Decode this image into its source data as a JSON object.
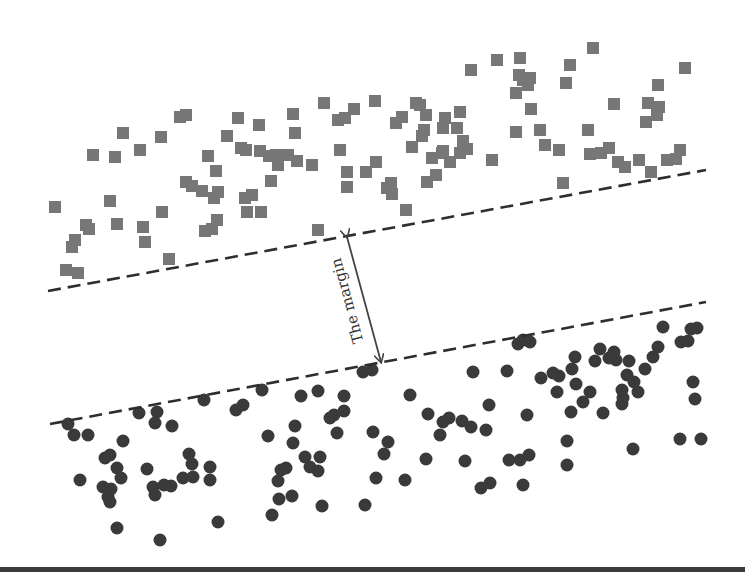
{
  "diagram": {
    "margin_label": "The margin",
    "colors": {
      "square": "#777777",
      "circle": "#3a3a3a",
      "line": "#2e2e2e",
      "arrow": "#444444",
      "text": "#333333"
    },
    "upper_boundary": {
      "x1": 48,
      "y1": 291,
      "x2": 706,
      "y2": 170,
      "style": "dashed"
    },
    "lower_boundary": {
      "x1": 50,
      "y1": 424,
      "x2": 706,
      "y2": 302,
      "style": "dashed"
    },
    "margin_arrow": {
      "x1": 347,
      "y1": 237,
      "x2": 381,
      "y2": 362
    },
    "squares": [
      [
        55,
        207
      ],
      [
        66,
        270
      ],
      [
        78,
        273
      ],
      [
        72,
        247
      ],
      [
        75,
        240
      ],
      [
        86,
        225
      ],
      [
        89,
        229
      ],
      [
        110,
        201
      ],
      [
        117,
        224
      ],
      [
        93,
        155
      ],
      [
        115,
        157
      ],
      [
        123,
        133
      ],
      [
        140,
        150
      ],
      [
        161,
        137
      ],
      [
        180,
        117
      ],
      [
        186,
        115
      ],
      [
        186,
        182
      ],
      [
        192,
        186
      ],
      [
        202,
        191
      ],
      [
        218,
        192
      ],
      [
        214,
        198
      ],
      [
        205,
        231
      ],
      [
        212,
        229
      ],
      [
        217,
        220
      ],
      [
        162,
        212
      ],
      [
        143,
        227
      ],
      [
        145,
        242
      ],
      [
        169,
        259
      ],
      [
        208,
        156
      ],
      [
        216,
        171
      ],
      [
        238,
        118
      ],
      [
        227,
        136
      ],
      [
        241,
        148
      ],
      [
        246,
        150
      ],
      [
        259,
        125
      ],
      [
        260,
        151
      ],
      [
        269,
        156
      ],
      [
        276,
        155
      ],
      [
        245,
        198
      ],
      [
        252,
        195
      ],
      [
        247,
        212
      ],
      [
        261,
        212
      ],
      [
        271,
        181
      ],
      [
        278,
        165
      ],
      [
        293,
        114
      ],
      [
        295,
        133
      ],
      [
        288,
        155
      ],
      [
        297,
        161
      ],
      [
        312,
        165
      ],
      [
        318,
        230
      ],
      [
        324,
        103
      ],
      [
        338,
        120
      ],
      [
        345,
        118
      ],
      [
        354,
        109
      ],
      [
        375,
        101
      ],
      [
        340,
        150
      ],
      [
        347,
        187
      ],
      [
        347,
        172
      ],
      [
        366,
        172
      ],
      [
        376,
        162
      ],
      [
        387,
        188
      ],
      [
        391,
        183
      ],
      [
        392,
        194
      ],
      [
        406,
        210
      ],
      [
        396,
        123
      ],
      [
        402,
        117
      ],
      [
        416,
        103
      ],
      [
        420,
        105
      ],
      [
        426,
        115
      ],
      [
        412,
        147
      ],
      [
        424,
        130
      ],
      [
        422,
        136
      ],
      [
        432,
        158
      ],
      [
        436,
        175
      ],
      [
        442,
        153
      ],
      [
        443,
        128
      ],
      [
        445,
        118
      ],
      [
        427,
        182
      ],
      [
        450,
        162
      ],
      [
        460,
        153
      ],
      [
        467,
        149
      ],
      [
        471,
        70
      ],
      [
        497,
        60
      ],
      [
        520,
        58
      ],
      [
        523,
        80
      ],
      [
        519,
        75
      ],
      [
        530,
        78
      ],
      [
        528,
        85
      ],
      [
        516,
        93
      ],
      [
        531,
        109
      ],
      [
        566,
        83
      ],
      [
        593,
        48
      ],
      [
        570,
        65
      ],
      [
        563,
        183
      ],
      [
        614,
        104
      ],
      [
        646,
        122
      ],
      [
        648,
        103
      ],
      [
        657,
        115
      ],
      [
        659,
        107
      ],
      [
        658,
        85
      ],
      [
        685,
        68
      ],
      [
        625,
        167
      ],
      [
        639,
        160
      ],
      [
        667,
        160
      ],
      [
        680,
        150
      ],
      [
        676,
        159
      ],
      [
        588,
        130
      ],
      [
        559,
        150
      ],
      [
        540,
        130
      ],
      [
        545,
        145
      ],
      [
        590,
        154
      ],
      [
        601,
        153
      ],
      [
        609,
        148
      ],
      [
        618,
        162
      ],
      [
        651,
        172
      ],
      [
        492,
        160
      ],
      [
        516,
        132
      ],
      [
        457,
        128
      ],
      [
        460,
        112
      ],
      [
        443,
        151
      ],
      [
        463,
        141
      ]
    ],
    "circles": [
      [
        68,
        424
      ],
      [
        74,
        435
      ],
      [
        88,
        435
      ],
      [
        123,
        441
      ],
      [
        105,
        458
      ],
      [
        110,
        455
      ],
      [
        117,
        468
      ],
      [
        121,
        478
      ],
      [
        80,
        480
      ],
      [
        103,
        487
      ],
      [
        108,
        497
      ],
      [
        110,
        502
      ],
      [
        111,
        489
      ],
      [
        147,
        469
      ],
      [
        153,
        487
      ],
      [
        155,
        495
      ],
      [
        171,
        486
      ],
      [
        164,
        485
      ],
      [
        183,
        478
      ],
      [
        189,
        454
      ],
      [
        193,
        477
      ],
      [
        192,
        464
      ],
      [
        210,
        467
      ],
      [
        210,
        480
      ],
      [
        218,
        522
      ],
      [
        160,
        540
      ],
      [
        117,
        528
      ],
      [
        139,
        413
      ],
      [
        157,
        412
      ],
      [
        155,
        423
      ],
      [
        172,
        426
      ],
      [
        204,
        400
      ],
      [
        236,
        410
      ],
      [
        243,
        405
      ],
      [
        262,
        390
      ],
      [
        268,
        436
      ],
      [
        301,
        396
      ],
      [
        318,
        391
      ],
      [
        334,
        415
      ],
      [
        330,
        418
      ],
      [
        363,
        372
      ],
      [
        372,
        370
      ],
      [
        295,
        426
      ],
      [
        293,
        443
      ],
      [
        281,
        470
      ],
      [
        278,
        481
      ],
      [
        310,
        467
      ],
      [
        318,
        471
      ],
      [
        286,
        468
      ],
      [
        305,
        457
      ],
      [
        320,
        457
      ],
      [
        337,
        433
      ],
      [
        344,
        411
      ],
      [
        344,
        396
      ],
      [
        373,
        432
      ],
      [
        384,
        454
      ],
      [
        388,
        442
      ],
      [
        376,
        478
      ],
      [
        365,
        505
      ],
      [
        322,
        506
      ],
      [
        292,
        496
      ],
      [
        279,
        499
      ],
      [
        272,
        515
      ],
      [
        410,
        395
      ],
      [
        428,
        414
      ],
      [
        443,
        422
      ],
      [
        449,
        418
      ],
      [
        462,
        421
      ],
      [
        471,
        427
      ],
      [
        486,
        430
      ],
      [
        489,
        405
      ],
      [
        507,
        371
      ],
      [
        518,
        344
      ],
      [
        523,
        340
      ],
      [
        530,
        342
      ],
      [
        473,
        372
      ],
      [
        440,
        435
      ],
      [
        405,
        480
      ],
      [
        426,
        459
      ],
      [
        465,
        461
      ],
      [
        490,
        483
      ],
      [
        481,
        488
      ],
      [
        520,
        460
      ],
      [
        509,
        460
      ],
      [
        527,
        415
      ],
      [
        541,
        378
      ],
      [
        559,
        376
      ],
      [
        572,
        369
      ],
      [
        575,
        357
      ],
      [
        576,
        384
      ],
      [
        590,
        392
      ],
      [
        595,
        361
      ],
      [
        600,
        349
      ],
      [
        609,
        358
      ],
      [
        614,
        352
      ],
      [
        629,
        361
      ],
      [
        627,
        375
      ],
      [
        634,
        382
      ],
      [
        645,
        369
      ],
      [
        653,
        357
      ],
      [
        658,
        347
      ],
      [
        663,
        327
      ],
      [
        681,
        342
      ],
      [
        693,
        382
      ],
      [
        688,
        341
      ],
      [
        691,
        329
      ],
      [
        697,
        328
      ],
      [
        695,
        399
      ],
      [
        622,
        390
      ],
      [
        623,
        398
      ],
      [
        622,
        404
      ],
      [
        603,
        413
      ],
      [
        557,
        392
      ],
      [
        571,
        412
      ],
      [
        567,
        441
      ],
      [
        567,
        465
      ],
      [
        529,
        455
      ],
      [
        523,
        485
      ],
      [
        553,
        373
      ],
      [
        583,
        402
      ],
      [
        616,
        360
      ],
      [
        633,
        449
      ],
      [
        680,
        439
      ],
      [
        701,
        439
      ],
      [
        638,
        392
      ]
    ]
  }
}
